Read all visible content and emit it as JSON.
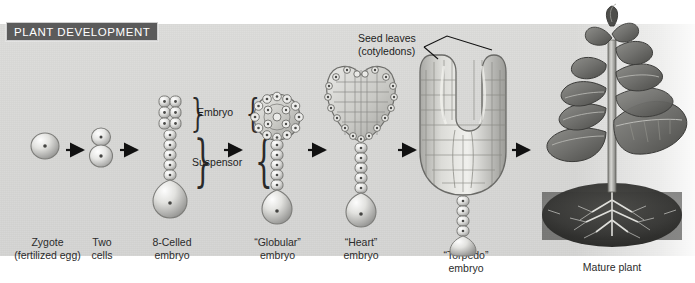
{
  "figure": {
    "title": "PLANT DEVELOPMENT",
    "title_bg": "#5b5b5b",
    "title_color": "#ffffff",
    "panel_bg": "#d8d8d6"
  },
  "callouts": {
    "seed_leaves": "Seed leaves\n(cotyledons)"
  },
  "brackets": [
    {
      "label": "Embryo"
    },
    {
      "label": "Suspensor"
    }
  ],
  "stages": [
    {
      "id": "zygote",
      "label": "Zygote\n(fertilized egg)"
    },
    {
      "id": "two-cells",
      "label": "Two\ncells"
    },
    {
      "id": "eight-celled",
      "label": "8-Celled\nembryo"
    },
    {
      "id": "globular",
      "label": "“Globular”\nembryo"
    },
    {
      "id": "heart",
      "label": "“Heart”\nembryo"
    },
    {
      "id": "torpedo",
      "label": "“Torpedo”\nembryo"
    },
    {
      "id": "mature",
      "label": "Mature plant"
    }
  ],
  "arrows": {
    "count": 6,
    "direction": "right",
    "color": "#111111"
  },
  "icons": {
    "arrow": "arrow-right-icon",
    "brace_left": "brace-left-icon",
    "brace_right": "brace-right-icon",
    "leader": "leader-line-icon"
  }
}
